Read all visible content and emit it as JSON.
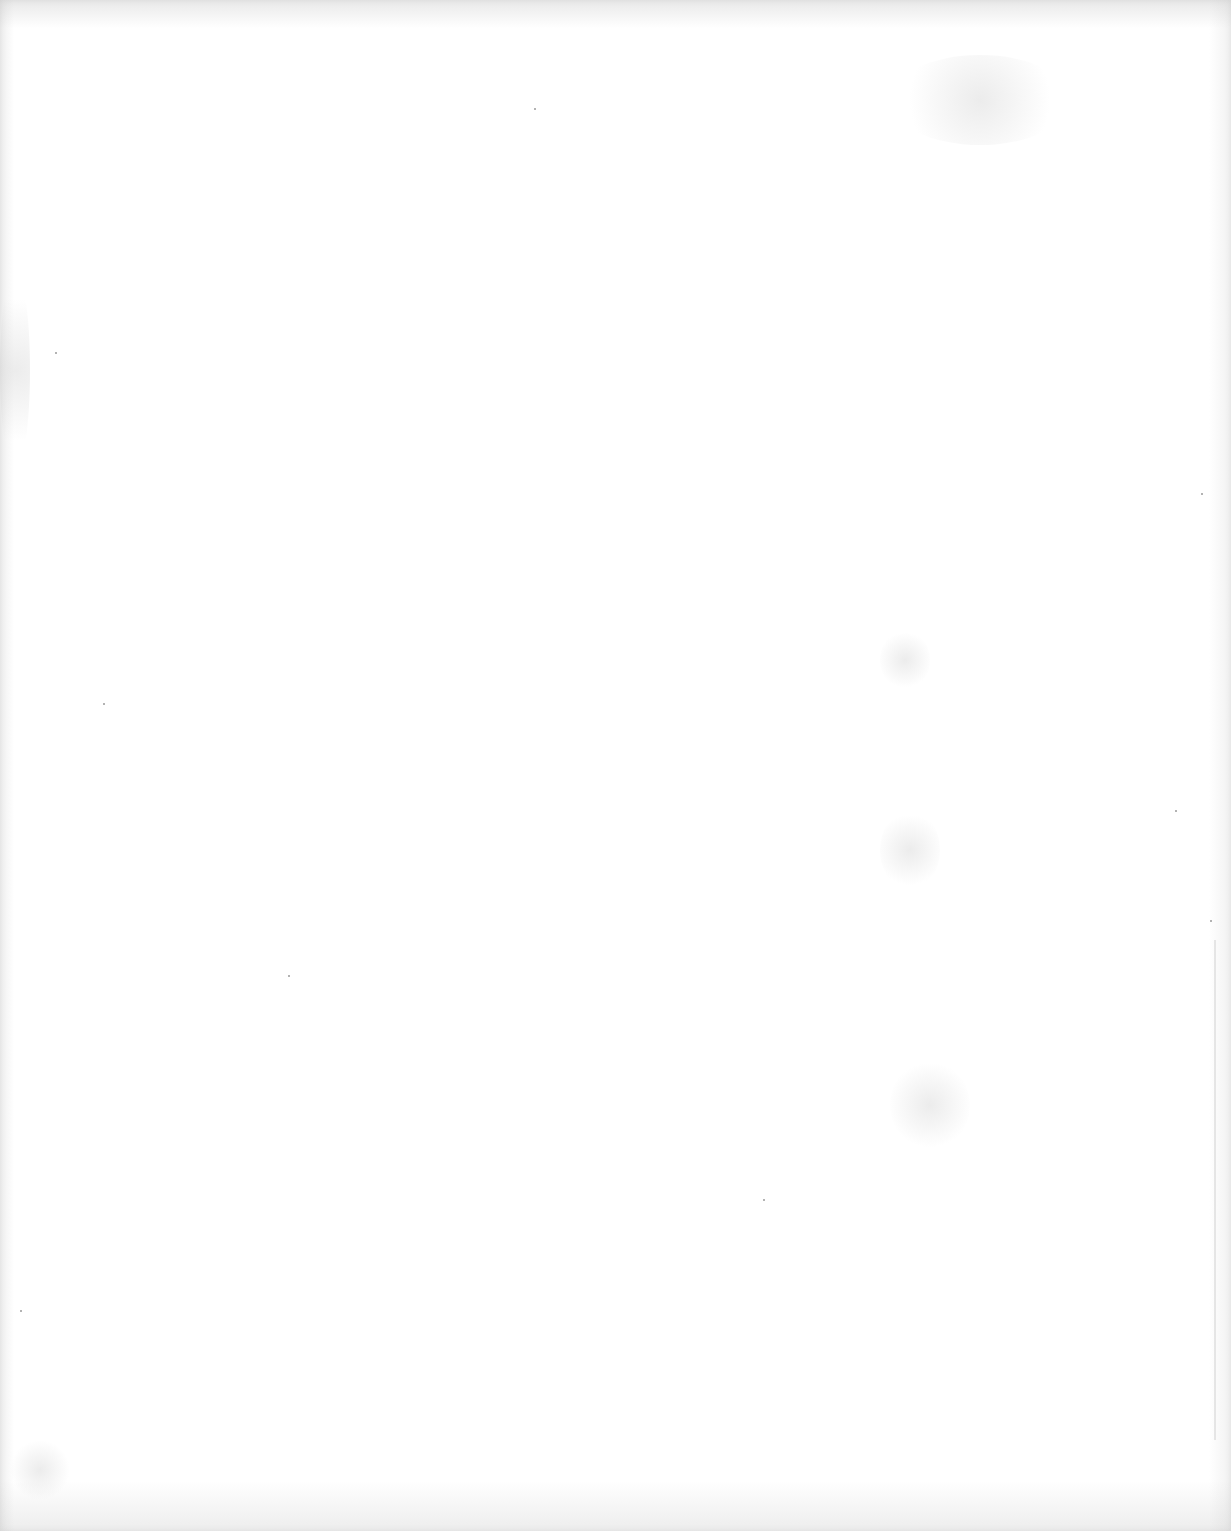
{
  "page": {
    "type": "blank-scanned-page",
    "text_content": [],
    "background_color": "#ffffff",
    "noise_color": "#c8c8c8"
  }
}
